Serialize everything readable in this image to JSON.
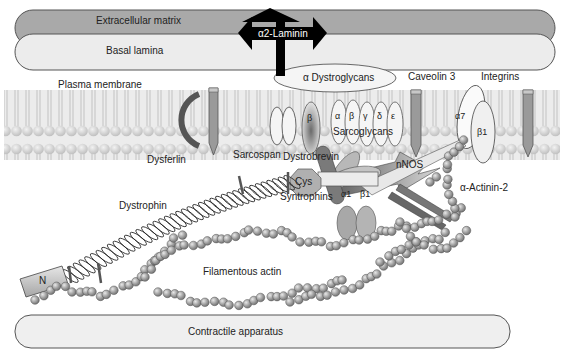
{
  "diagram": {
    "layers": {
      "extracellular_matrix": "Extracellular matrix",
      "basal_lamina": "Basal lamina",
      "plasma_membrane": "Plasma membrane",
      "contractile_apparatus": "Contractile apparatus"
    },
    "proteins": {
      "laminin": "α2-Laminin",
      "dystroglycans": "α Dystroglycans",
      "caveolin": "Caveolin 3",
      "integrins": "Integrins",
      "integrin_a7": "α7",
      "integrin_b1": "β1",
      "dysferlin": "Dysferlin",
      "sarcospan": "Sarcospan",
      "beta_dystroglycan": "β",
      "sarcoglycan_letters": [
        "α",
        "β",
        "γ",
        "δ",
        "ε"
      ],
      "sarcoglycans": "Sarcoglycans",
      "dystrobrevin": "Dystrobrevin",
      "nnos": "nNOS",
      "cys": "Cys",
      "syntrophin_a1": "α1",
      "syntrophin_b1": "β1",
      "syntrophins": "Syntrophins",
      "actinin": "α-Actinin-2",
      "dystrophin": "Dystrophin",
      "n_terminal": "N",
      "actin": "Filamentous actin"
    },
    "colors": {
      "ecm": "#a9a9a9",
      "basal_lamina": "#ececec",
      "membrane": "#d4d4d4",
      "arrow": "#000000",
      "protein_dark": "#7a7a7a",
      "protein_mid": "#b0b0b0",
      "bead": "#9a9a9a"
    }
  }
}
